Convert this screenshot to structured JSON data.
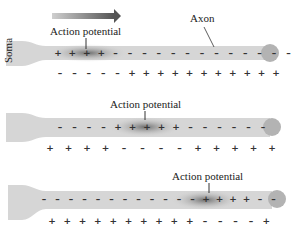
{
  "labels": {
    "direction_arrow": "propagation-direction",
    "action_potential": "Action potential",
    "axon": "Axon",
    "soma": "Soma"
  },
  "colors": {
    "axon_fill": "#d4d4d4",
    "terminal_fill": "#b8b8b8",
    "ap_dark": "#7a7a7a",
    "arrow_dark": "#555555",
    "arrow_light": "#cfcfcf"
  },
  "panels": [
    {
      "y": 52,
      "ap_center_x": 88,
      "ap_label_x": 26,
      "ap_label_y": 28,
      "inside_signs": [
        "+",
        "+",
        "+",
        "+",
        "-",
        "-",
        "-",
        "-",
        "-",
        "-",
        "-",
        "-",
        "-",
        "-",
        "-",
        "-",
        "-"
      ],
      "outside_signs": [
        "-",
        "-",
        "-",
        "-",
        "-",
        "+",
        "+",
        "+",
        "+",
        "+",
        "+",
        "+",
        "+",
        "+",
        "+",
        "+"
      ],
      "show_axon_label": true
    },
    {
      "y": 127,
      "ap_center_x": 145,
      "ap_label_x": 110,
      "ap_label_y": 99,
      "inside_signs": [
        "-",
        "-",
        "-",
        "-",
        "+",
        "+",
        "+",
        "+",
        "+",
        "-",
        "-",
        "-",
        "-",
        "-",
        "-"
      ],
      "outside_signs": [
        "+",
        "+",
        "+",
        "+",
        "-",
        "-",
        "-",
        "-",
        "+",
        "+",
        "+",
        "+",
        "+"
      ]
    },
    {
      "y": 202,
      "ap_center_x": 205,
      "ap_label_x": 172,
      "ap_label_y": 171,
      "inside_signs": [
        "-",
        "-",
        "-",
        "-",
        "-",
        "-",
        "-",
        "-",
        "-",
        "-",
        "-",
        "-",
        "+",
        "+",
        "+",
        "+",
        "-",
        "-"
      ],
      "outside_signs": [
        "+",
        "+",
        "+",
        "+",
        "+",
        "+",
        "+",
        "+",
        "+",
        "+",
        "-",
        "-",
        "-",
        "-",
        "+"
      ]
    }
  ]
}
